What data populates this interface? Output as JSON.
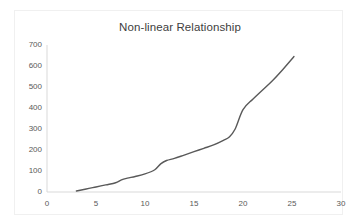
{
  "chart_data": {
    "type": "line",
    "title": "Non-linear Relationship",
    "xlabel": "",
    "ylabel": "",
    "xlim": [
      0,
      30
    ],
    "ylim": [
      0,
      700
    ],
    "xticks": [
      0,
      5,
      10,
      15,
      20,
      25,
      30
    ],
    "yticks": [
      0,
      100,
      200,
      300,
      400,
      500,
      600,
      700
    ],
    "grid": false,
    "legend": false,
    "legend_position": "none",
    "series": [
      {
        "name": "series-1",
        "color": "#595959",
        "x": [
          3.0,
          4.0,
          5.0,
          6.0,
          7.0,
          7.6,
          8.2,
          9.0,
          10.0,
          11.0,
          11.6,
          12.2,
          13.0,
          14.0,
          15.0,
          16.0,
          17.0,
          18.0,
          18.6,
          19.2,
          20.0,
          21.0,
          22.0,
          23.0,
          24.0,
          25.2
        ],
        "y": [
          5,
          14,
          24,
          34,
          44,
          58,
          66,
          74,
          86,
          106,
          134,
          150,
          160,
          176,
          192,
          208,
          224,
          246,
          262,
          300,
          392,
          442,
          486,
          530,
          580,
          645
        ]
      }
    ],
    "x_tick_labels": [
      "0",
      "5",
      "10",
      "15",
      "20",
      "25",
      "30"
    ],
    "y_tick_labels": [
      "0",
      "100",
      "200",
      "300",
      "400",
      "500",
      "600",
      "700"
    ]
  },
  "style": {
    "line_color": "#595959",
    "axis_color": "#d9d9d9",
    "title_color": "#404040",
    "tick_color": "#595959",
    "frame_color": "#f0f0f0",
    "background": "#ffffff"
  }
}
